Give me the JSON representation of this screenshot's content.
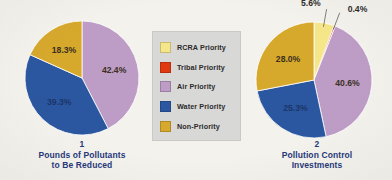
{
  "figure": {
    "background_color": "#f4f2ed",
    "legend": {
      "background_color": "#d8d8d6",
      "position": "center",
      "items": [
        {
          "label": "RCRA Priority",
          "color": "#f6e68a"
        },
        {
          "label": "Tribal Priority",
          "color": "#e03a10"
        },
        {
          "label": "Air Priority",
          "color": "#bd9cc6"
        },
        {
          "label": "Water Priority",
          "color": "#2b57a0"
        },
        {
          "label": "Non-Priority",
          "color": "#d6a82c"
        }
      ]
    }
  },
  "chart_data": [
    {
      "type": "pie",
      "id": "chart-1",
      "title": "Pounds of Pollutants to Be Reduced",
      "number": "1",
      "caption_line_1": "Pounds of Pollutants",
      "caption_line_2": "to Be Reduced",
      "categories": [
        "RCRA Priority",
        "Tribal Priority",
        "Air Priority",
        "Water Priority",
        "Non-Priority"
      ],
      "values": [
        0.0,
        0.0,
        42.4,
        39.3,
        18.3
      ],
      "colors": [
        "#f6e68a",
        "#e03a10",
        "#bd9cc6",
        "#2b57a0",
        "#d6a82c"
      ],
      "labels": [
        "",
        "",
        "42.4%",
        "39.3%",
        "18.3%"
      ],
      "unit": "percent",
      "start_angle_deg": 0,
      "direction": "clockwise"
    },
    {
      "type": "pie",
      "id": "chart-2",
      "title": "Pollution Control Investments",
      "number": "2",
      "caption_line_1": "Pollution Control",
      "caption_line_2": "Investments",
      "categories": [
        "RCRA Priority",
        "Tribal Priority",
        "Air Priority",
        "Water Priority",
        "Non-Priority"
      ],
      "values": [
        5.6,
        0.4,
        40.6,
        25.3,
        28.0
      ],
      "colors": [
        "#f6e68a",
        "#e03a10",
        "#bd9cc6",
        "#2b57a0",
        "#d6a82c"
      ],
      "labels": [
        "5.6%",
        "0.4%",
        "40.6%",
        "25.3%",
        "28.0%"
      ],
      "unit": "percent",
      "start_angle_deg": 0,
      "direction": "clockwise"
    }
  ]
}
